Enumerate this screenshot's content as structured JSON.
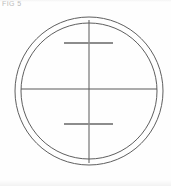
{
  "figure": {
    "label": "FIG 5",
    "label_color": "#b9b9b9",
    "background_color": "#fefefe",
    "canvas": {
      "width": 171,
      "height": 186
    }
  },
  "drawing": {
    "type": "reticle-crosshair-diagram",
    "description": "Two concentric circles with a full-width horizontal diameter line, a vertical centerline, and two short horizontal tick bars above and below center",
    "center": {
      "x": 89,
      "y": 89
    },
    "stroke_color_thin": "#585858",
    "stroke_color_bar": "#8c8c8c",
    "stroke_width_thin": 1,
    "stroke_width_bar": 2,
    "shapes": [
      {
        "name": "outer-circle",
        "kind": "circle",
        "cx": 89,
        "cy": 91,
        "r": 74,
        "stroke": "#5e5e5e",
        "stroke_width": 1,
        "fill": "none"
      },
      {
        "name": "inner-circle",
        "kind": "circle",
        "cx": 89,
        "cy": 91,
        "r": 68,
        "stroke": "#5e5e5e",
        "stroke_width": 1,
        "fill": "none"
      },
      {
        "name": "horizontal-diameter-line",
        "kind": "line",
        "x1": 21,
        "y1": 89,
        "x2": 157,
        "y2": 89,
        "stroke": "#585858",
        "stroke_width": 1
      },
      {
        "name": "vertical-center-line",
        "kind": "line",
        "x1": 89,
        "y1": 20,
        "x2": 89,
        "y2": 163,
        "stroke": "#585858",
        "stroke_width": 1
      },
      {
        "name": "upper-tick-bar",
        "kind": "line",
        "x1": 64,
        "y1": 43,
        "x2": 113,
        "y2": 43,
        "stroke": "#8c8c8c",
        "stroke_width": 2
      },
      {
        "name": "lower-tick-bar",
        "kind": "line",
        "x1": 64,
        "y1": 124,
        "x2": 113,
        "y2": 124,
        "stroke": "#8c8c8c",
        "stroke_width": 2
      }
    ]
  }
}
